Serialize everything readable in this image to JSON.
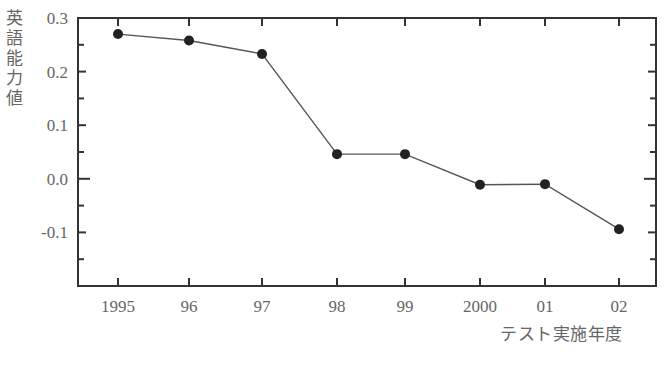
{
  "chart_data": {
    "type": "line",
    "title": "",
    "xlabel": "テスト実施年度",
    "ylabel": "英語能力値",
    "categories": [
      "1995",
      "96",
      "97",
      "98",
      "99",
      "2000",
      "01",
      "02"
    ],
    "series": [
      {
        "name": "英語能力値",
        "values": [
          0.27,
          0.258,
          0.233,
          0.046,
          0.046,
          -0.011,
          -0.01,
          -0.094
        ]
      }
    ],
    "ylim": [
      -0.2,
      0.3
    ],
    "yticks": [
      "0.3",
      "0.2",
      "0.1",
      "0.0",
      "-0.1"
    ],
    "grid": false,
    "legend": "none",
    "colors": {
      "line": "#555555",
      "marker": "#222222",
      "axis": "#333333"
    }
  }
}
